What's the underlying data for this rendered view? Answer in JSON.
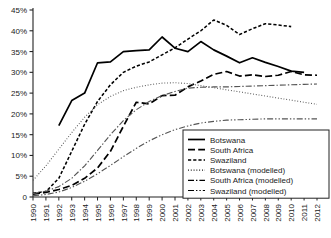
{
  "chart_data": {
    "type": "line",
    "title": "",
    "subtitle": "",
    "xlabel": "",
    "ylabel": "",
    "xlim": [
      1990,
      2012
    ],
    "ylim": [
      0,
      45
    ],
    "ytick_labels": [
      "0",
      "5%",
      "10%",
      "15%",
      "20%",
      "25%",
      "30%",
      "35%",
      "40%",
      "45%"
    ],
    "ytick_values": [
      0,
      5,
      10,
      15,
      20,
      25,
      30,
      35,
      40,
      45
    ],
    "x": [
      1990,
      1991,
      1992,
      1993,
      1994,
      1995,
      1996,
      1997,
      1998,
      1999,
      2000,
      2001,
      2002,
      2003,
      2004,
      2005,
      2006,
      2007,
      2008,
      2009,
      2010,
      2011,
      2012
    ],
    "xtick_labels": [
      "1990",
      "1991",
      "1992",
      "1993",
      "1994",
      "1995",
      "1996",
      "1997",
      "1998",
      "1999",
      "2000",
      "2001",
      "2002",
      "2003",
      "2004",
      "2005",
      "2006",
      "2007",
      "2008",
      "2009",
      "2010",
      "2011",
      "2012"
    ],
    "grid": false,
    "legend_position": "bottom-right",
    "series": [
      {
        "name": "Botswana",
        "style": "solid",
        "color": "#000000",
        "x": [
          1992,
          1993,
          1994,
          1995,
          1996,
          1997,
          1998,
          1999,
          2000,
          2001,
          2002,
          2003,
          2004,
          2005,
          2006,
          2007,
          2008,
          2009,
          2010,
          2011
        ],
        "values": [
          17.2,
          23.2,
          25.0,
          32.3,
          32.5,
          35.0,
          35.2,
          35.4,
          38.5,
          35.8,
          35.0,
          37.4,
          35.4,
          33.9,
          32.3,
          33.5,
          32.4,
          31.4,
          30.3,
          30.0
        ]
      },
      {
        "name": "South Africa",
        "style": "dashed",
        "color": "#000000",
        "x": [
          1990,
          1991,
          1992,
          1993,
          1994,
          1995,
          1996,
          1997,
          1998,
          1999,
          2000,
          2001,
          2002,
          2003,
          2004,
          2005,
          2006,
          2007,
          2008,
          2009,
          2010,
          2011,
          2012
        ],
        "values": [
          0.7,
          1.1,
          1.8,
          2.8,
          4.5,
          7.0,
          11.0,
          17.0,
          22.8,
          22.4,
          24.4,
          24.5,
          26.5,
          27.9,
          29.5,
          30.2,
          29.1,
          29.4,
          29.0,
          29.3,
          30.2,
          29.4,
          29.3
        ]
      },
      {
        "name": "Swaziland",
        "style": "dotted-dash",
        "color": "#000000",
        "x": [
          1990,
          1991,
          1992,
          1993,
          1994,
          1995,
          1996,
          1997,
          1998,
          1999,
          2000,
          2001,
          2002,
          2003,
          2004,
          2005,
          2006,
          2007,
          2008,
          2009,
          2010
        ],
        "values": [
          0.9,
          1.3,
          4.5,
          11.0,
          17.5,
          23.0,
          27.0,
          30.0,
          31.5,
          32.5,
          34.2,
          35.9,
          38.0,
          40.0,
          42.6,
          41.3,
          39.1,
          40.5,
          41.7,
          41.4,
          41.0
        ]
      },
      {
        "name": "Botswana (modelled)",
        "style": "fine-dotted",
        "color": "#555555",
        "x": [
          1990,
          1991,
          1992,
          1993,
          1994,
          1995,
          1996,
          1997,
          1998,
          1999,
          2000,
          2001,
          2002,
          2003,
          2004,
          2005,
          2006,
          2007,
          2008,
          2009,
          2010,
          2011,
          2012
        ],
        "values": [
          4.0,
          7.5,
          11.5,
          15.5,
          19.2,
          22.2,
          24.2,
          25.6,
          26.4,
          27.0,
          27.4,
          27.5,
          27.3,
          26.8,
          26.3,
          25.8,
          25.3,
          24.8,
          24.3,
          23.8,
          23.3,
          22.8,
          22.3
        ]
      },
      {
        "name": "South Africa (modelled)",
        "style": "dash-dot",
        "color": "#555555",
        "x": [
          1990,
          1991,
          1992,
          1993,
          1994,
          1995,
          1996,
          1997,
          1998,
          1999,
          2000,
          2001,
          2002,
          2003,
          2004,
          2005,
          2006,
          2007,
          2008,
          2009,
          2010,
          2011,
          2012
        ],
        "values": [
          0.8,
          1.4,
          2.5,
          4.5,
          7.5,
          11.2,
          15.0,
          18.4,
          21.0,
          23.0,
          24.4,
          25.4,
          26.2,
          26.4,
          26.5,
          26.5,
          26.6,
          26.7,
          26.8,
          26.9,
          27.0,
          27.1,
          27.2
        ]
      },
      {
        "name": "Swaziland (modelled)",
        "style": "dash-dot-dot",
        "color": "#555555",
        "x": [
          1990,
          1991,
          1992,
          1993,
          1994,
          1995,
          1996,
          1997,
          1998,
          1999,
          2000,
          2001,
          2002,
          2003,
          2004,
          2005,
          2006,
          2007,
          2008,
          2009,
          2010,
          2011,
          2012
        ],
        "values": [
          0.3,
          0.6,
          1.2,
          2.3,
          3.8,
          5.6,
          7.6,
          9.7,
          11.7,
          13.5,
          15.0,
          16.2,
          17.1,
          17.8,
          18.2,
          18.5,
          18.6,
          18.7,
          18.8,
          18.8,
          18.8,
          18.8,
          18.8
        ]
      }
    ],
    "legend_entries": [
      {
        "label": "Botswana",
        "style": "solid"
      },
      {
        "label": "South Africa",
        "style": "dashed"
      },
      {
        "label": "Swaziland",
        "style": "dotted-dash"
      },
      {
        "label": "Botswana (modelled)",
        "style": "fine-dotted"
      },
      {
        "label": "South Africa (modelled)",
        "style": "dash-dot"
      },
      {
        "label": "Swaziland (modelled)",
        "style": "dash-dot-dot"
      }
    ]
  }
}
